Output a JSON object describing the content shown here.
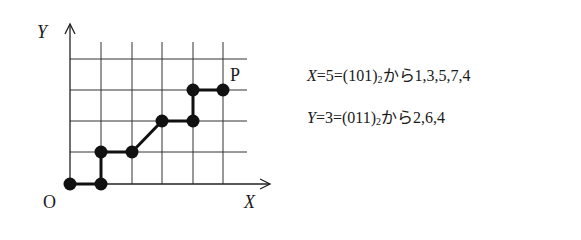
{
  "diagram": {
    "axis_labels": {
      "x": "X",
      "y": "Y",
      "origin": "O",
      "point": "P"
    },
    "grid": {
      "x_lines": [
        70,
        101,
        132,
        162,
        193,
        223
      ],
      "y_lines": [
        59,
        90,
        121,
        152,
        184
      ]
    },
    "path_points": [
      [
        0,
        0
      ],
      [
        1,
        0
      ],
      [
        1,
        1
      ],
      [
        2,
        1
      ],
      [
        3,
        2
      ],
      [
        4,
        2
      ],
      [
        4,
        3
      ],
      [
        5,
        3
      ]
    ]
  },
  "equations": [
    {
      "var": "X",
      "value": "5",
      "binary": "(101)",
      "base": "2",
      "connector": "から",
      "sequence": "1,3,5,7,4"
    },
    {
      "var": "Y",
      "value": "3",
      "binary": "(011)",
      "base": "2",
      "connector": "から",
      "sequence": "2,6,4"
    }
  ]
}
